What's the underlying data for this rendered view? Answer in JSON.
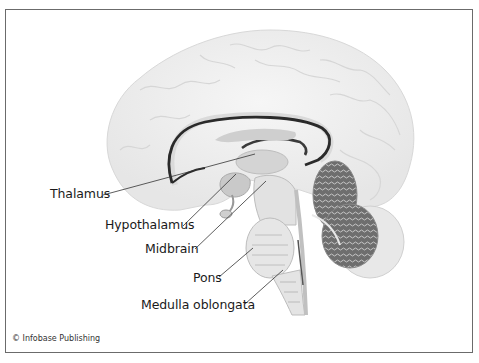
{
  "figure": {
    "credit": "© Infobase Publishing"
  },
  "labels": [
    {
      "id": "thalamus",
      "text": "Thalamus"
    },
    {
      "id": "hypothalamus",
      "text": "Hypothalamus"
    },
    {
      "id": "midbrain",
      "text": "Midbrain"
    },
    {
      "id": "pons",
      "text": "Pons"
    },
    {
      "id": "medulla",
      "text": "Medulla oblongata"
    }
  ],
  "colors": {
    "frame": "#6b6b6b",
    "cortex": "#eeeeee",
    "corpus_callosum_outline": "#2a2a2a",
    "cerebellum": "#7a7a7a",
    "leader_line": "#333333"
  }
}
